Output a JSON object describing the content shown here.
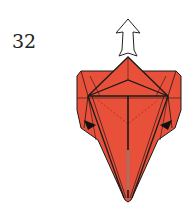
{
  "step": {
    "number": "32"
  },
  "diagram": {
    "paper_color": "#e8503a",
    "line_color": "#1a1a1a",
    "arrow": {
      "type": "hollow-push-arrow",
      "direction": "up",
      "fill": "#ffffff"
    },
    "markers": [
      {
        "type": "black-triangle-arrow",
        "side": "left"
      },
      {
        "type": "black-triangle-arrow",
        "side": "right"
      }
    ]
  }
}
